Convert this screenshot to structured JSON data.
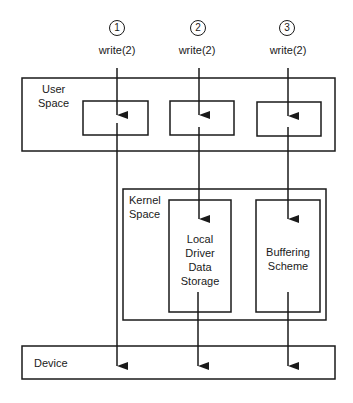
{
  "diagram": {
    "columns": [
      {
        "number": "1",
        "call": "write(2)"
      },
      {
        "number": "2",
        "call": "write(2)"
      },
      {
        "number": "3",
        "call": "write(2)"
      }
    ],
    "regions": {
      "user_space": "User\nSpace",
      "user_space_line1": "User",
      "user_space_line2": "Space",
      "kernel_space_line1": "Kernel",
      "kernel_space_line2": "Space",
      "device": "Device"
    },
    "kernel_boxes": {
      "local_driver": [
        "Local",
        "Driver",
        "Data",
        "Storage"
      ],
      "buffering": [
        "Buffering",
        "Scheme"
      ]
    },
    "colors": {
      "stroke": "#1a1a1a",
      "background": "#ffffff"
    }
  }
}
